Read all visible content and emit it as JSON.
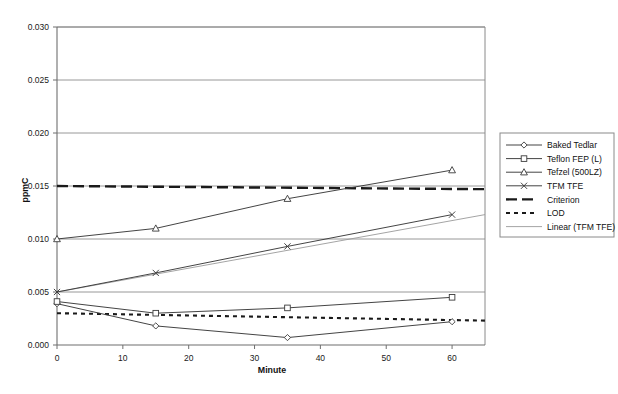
{
  "chart_data": {
    "type": "line",
    "title": "",
    "xlabel": "Minute",
    "ylabel": "ppmC",
    "xlim": [
      0,
      65
    ],
    "ylim": [
      0,
      0.03
    ],
    "grid": true,
    "legend_position": "right",
    "x": [
      0,
      15,
      35,
      60
    ],
    "xticks": [
      0,
      10,
      20,
      30,
      40,
      50,
      60
    ],
    "xtick_labels": [
      "0",
      "10",
      "20",
      "30",
      "40",
      "50",
      "60"
    ],
    "yticks": [
      0.0,
      0.005,
      0.01,
      0.015,
      0.02,
      0.025,
      0.03
    ],
    "ytick_labels": [
      "0.000",
      "0.005",
      "0.010",
      "0.015",
      "0.020",
      "0.025",
      "0.030"
    ],
    "series": [
      {
        "name": "Baked Tedlar",
        "marker": "diamond",
        "values": [
          0.0039,
          0.0018,
          0.0007,
          0.0022
        ]
      },
      {
        "name": "Teflon FEP (L)",
        "marker": "square",
        "values": [
          0.0041,
          0.003,
          0.0035,
          0.0045
        ]
      },
      {
        "name": "Tefzel (500LZ)",
        "marker": "triangle",
        "values": [
          0.01,
          0.011,
          0.0138,
          0.0165
        ]
      },
      {
        "name": "TFM TFE",
        "marker": "cross",
        "values": [
          0.005,
          0.0068,
          0.0093,
          0.0123
        ]
      }
    ],
    "reference_lines": [
      {
        "name": "Criterion",
        "style": "thick-dashed",
        "value_start": 0.015,
        "value_end": 0.0147
      },
      {
        "name": "LOD",
        "style": "dotted",
        "value_start": 0.003,
        "value_end": 0.0023
      }
    ],
    "trendlines": [
      {
        "name": "Linear (TFM TFE)",
        "style": "thin-solid",
        "value_start": 0.005,
        "value_end": 0.0123
      }
    ],
    "legend": [
      {
        "label": "Baked Tedlar",
        "marker": "diamond",
        "style": "line-marker"
      },
      {
        "label": "Teflon FEP (L)",
        "marker": "square",
        "style": "line-marker"
      },
      {
        "label": "Tefzel (500LZ)",
        "marker": "triangle",
        "style": "line-marker"
      },
      {
        "label": "TFM TFE",
        "marker": "cross",
        "style": "line-marker"
      },
      {
        "label": "Criterion",
        "marker": "none",
        "style": "thick-dashed"
      },
      {
        "label": "LOD",
        "marker": "none",
        "style": "dotted"
      },
      {
        "label": "Linear (TFM TFE)",
        "marker": "none",
        "style": "thin-solid"
      }
    ],
    "colors": {
      "series": "#3a3a3a",
      "grid": "#8d8d8d",
      "axis": "#6f6f6f",
      "reference": "#1a1a1a",
      "trend": "#9a9a9a",
      "background": "#ffffff"
    }
  }
}
